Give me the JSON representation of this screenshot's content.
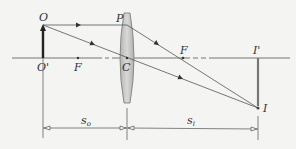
{
  "diagram": {
    "type": "thin converging lens ray diagram",
    "labels": {
      "object_tip": "O",
      "object_base": "O'",
      "focal_left": "F",
      "lens_top_point": "P",
      "lens_center": "C",
      "focal_right": "F",
      "image_base": "I'",
      "image_tip": "I"
    },
    "dimensions": {
      "object_distance": {
        "main": "s",
        "sub": "o"
      },
      "image_distance": {
        "main": "s",
        "sub": "i"
      }
    },
    "colors": {
      "background": "#f4f4f2",
      "line": "#555555",
      "object": "#222222",
      "lens_fill": "#c8c8c8",
      "lens_stroke": "#777777",
      "image": "#777777"
    }
  }
}
